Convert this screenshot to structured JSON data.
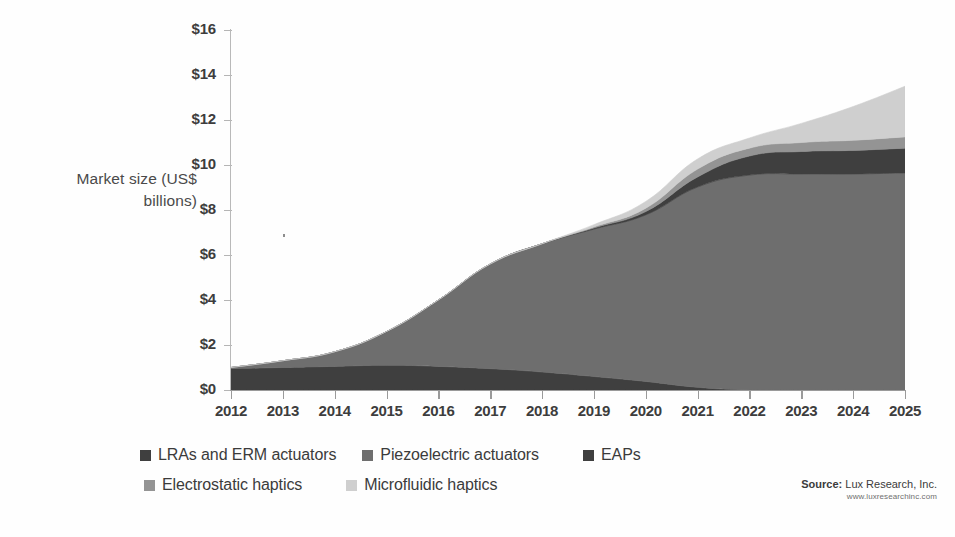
{
  "axis": {
    "y_label_line1": "Market size (US$",
    "y_label_line2": "billions)",
    "y_ticks": [
      "$0",
      "$2",
      "$4",
      "$6",
      "$8",
      "$10",
      "$12",
      "$14",
      "$16"
    ]
  },
  "legend": {
    "row1": [
      {
        "label": "LRAs and ERM actuators",
        "color": "#3f3f3f"
      },
      {
        "label": "Piezoelectric actuators",
        "color": "#6e6e6e"
      },
      {
        "label": "EAPs",
        "color": "#3f3f3f"
      }
    ],
    "row2": [
      {
        "label": "Electrostatic haptics",
        "color": "#949494"
      },
      {
        "label": "Microfluidic haptics",
        "color": "#cfcfcf"
      }
    ]
  },
  "source": {
    "prefix": "Source:",
    "name": " Lux Research, Inc.",
    "url": "www.luxresearchinc.com"
  },
  "chart_data": {
    "type": "area",
    "title": "",
    "xlabel": "",
    "ylabel": "Market size (US$ billions)",
    "ylim": [
      0,
      16
    ],
    "ytick_step": 2,
    "grid": false,
    "stacked": true,
    "legend_position": "bottom",
    "categories": [
      "2012",
      "2013",
      "2014",
      "2015",
      "2016",
      "2017",
      "2018",
      "2019",
      "2020",
      "2021",
      "2022",
      "2023",
      "2024",
      "2025"
    ],
    "series": [
      {
        "name": "LRAs and ERM actuators",
        "color": "#3f3f3f",
        "values": [
          0.95,
          1.0,
          1.05,
          1.1,
          1.05,
          0.95,
          0.8,
          0.6,
          0.38,
          0.12,
          0.0,
          0.0,
          0.0,
          0.0
        ]
      },
      {
        "name": "Piezoelectric actuators",
        "color": "#6e6e6e",
        "values": [
          0.05,
          0.3,
          0.65,
          1.5,
          2.95,
          4.65,
          5.7,
          6.55,
          7.4,
          8.9,
          9.55,
          9.6,
          9.6,
          9.65
        ]
      },
      {
        "name": "EAPs",
        "color": "#3f3f3f",
        "values": [
          0.0,
          0.0,
          0.0,
          0.0,
          0.0,
          0.0,
          0.0,
          0.05,
          0.15,
          0.45,
          0.85,
          1.0,
          1.05,
          1.1
        ]
      },
      {
        "name": "Electrostatic haptics",
        "color": "#949494",
        "values": [
          0.0,
          0.0,
          0.0,
          0.0,
          0.0,
          0.0,
          0.0,
          0.05,
          0.15,
          0.35,
          0.35,
          0.4,
          0.45,
          0.5
        ]
      },
      {
        "name": "Microfluidic haptics",
        "color": "#cfcfcf",
        "values": [
          0.0,
          0.0,
          0.0,
          0.0,
          0.0,
          0.0,
          0.0,
          0.1,
          0.3,
          0.45,
          0.45,
          0.85,
          1.5,
          2.25
        ]
      }
    ],
    "totals": [
      1.0,
      1.3,
      1.7,
      2.6,
      4.0,
      5.6,
      6.5,
      7.35,
      8.38,
      10.27,
      11.2,
      11.85,
      12.6,
      13.5
    ]
  }
}
